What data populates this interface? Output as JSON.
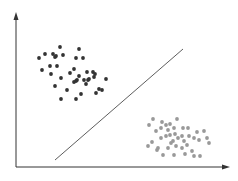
{
  "diagram": {
    "type": "scatter-classification",
    "colors": {
      "background": "#ffffff",
      "axis": "#333333",
      "line": "#333333",
      "class_a": "#333333",
      "class_b": "#999999"
    },
    "axes": {
      "origin": [
        16,
        167
      ],
      "y_top": [
        16,
        12
      ],
      "x_end": [
        230,
        167
      ]
    },
    "separator": {
      "from": [
        55,
        160
      ],
      "to": [
        183,
        49
      ]
    },
    "class_a_points": [
      [
        39,
        58
      ],
      [
        45,
        54
      ],
      [
        53,
        54
      ],
      [
        55,
        57
      ],
      [
        56,
        56
      ],
      [
        60,
        47
      ],
      [
        63,
        55
      ],
      [
        79,
        49
      ],
      [
        76,
        58
      ],
      [
        83,
        58
      ],
      [
        42,
        70
      ],
      [
        50,
        66
      ],
      [
        51,
        74
      ],
      [
        57,
        66
      ],
      [
        61,
        78
      ],
      [
        55,
        86
      ],
      [
        67,
        90
      ],
      [
        61,
        99
      ],
      [
        76,
        99
      ],
      [
        81,
        94
      ],
      [
        70,
        73
      ],
      [
        74,
        69
      ],
      [
        76,
        81
      ],
      [
        74,
        82
      ],
      [
        77,
        80
      ],
      [
        79,
        76
      ],
      [
        84,
        80
      ],
      [
        87,
        72
      ],
      [
        88,
        80
      ],
      [
        86,
        84
      ],
      [
        93,
        72
      ],
      [
        95,
        74
      ],
      [
        89,
        79
      ],
      [
        94,
        77
      ],
      [
        106,
        79
      ],
      [
        99,
        89
      ],
      [
        102,
        90
      ],
      [
        96,
        93
      ]
    ],
    "class_b_points": [
      [
        153,
        119
      ],
      [
        149,
        125
      ],
      [
        162,
        122
      ],
      [
        166,
        125
      ],
      [
        170,
        124
      ],
      [
        177,
        119
      ],
      [
        156,
        131
      ],
      [
        161,
        128
      ],
      [
        168,
        130
      ],
      [
        174,
        128
      ],
      [
        183,
        128
      ],
      [
        188,
        128
      ],
      [
        197,
        132
      ],
      [
        204,
        131
      ],
      [
        152,
        142
      ],
      [
        148,
        146
      ],
      [
        158,
        148
      ],
      [
        161,
        138
      ],
      [
        166,
        136
      ],
      [
        170,
        135
      ],
      [
        173,
        141
      ],
      [
        175,
        134
      ],
      [
        178,
        138
      ],
      [
        182,
        136
      ],
      [
        184,
        141
      ],
      [
        189,
        136
      ],
      [
        194,
        138
      ],
      [
        199,
        140
      ],
      [
        207,
        138
      ],
      [
        168,
        148
      ],
      [
        171,
        143
      ],
      [
        176,
        146
      ],
      [
        182,
        148
      ],
      [
        187,
        145
      ],
      [
        192,
        151
      ],
      [
        185,
        154
      ],
      [
        174,
        155
      ],
      [
        163,
        155
      ],
      [
        157,
        150
      ],
      [
        194,
        156
      ],
      [
        200,
        156
      ],
      [
        209,
        143
      ]
    ]
  }
}
